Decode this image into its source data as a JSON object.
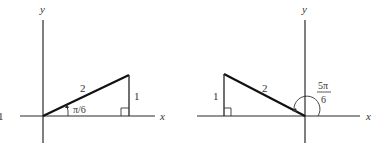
{
  "figure": {
    "panels": [
      {
        "id": "left",
        "axis_labels": {
          "x": "x",
          "y": "y"
        },
        "hypotenuse_label": "2",
        "opposite_label": "1",
        "angle_label": "π/6",
        "edge_fragment": "1",
        "triangle": {
          "origin": [
            43,
            116
          ],
          "top": [
            129,
            75
          ],
          "right_angle": [
            129,
            116
          ]
        }
      },
      {
        "id": "right",
        "axis_labels": {
          "x": "x",
          "y": "y"
        },
        "hypotenuse_label": "2",
        "opposite_label": "1",
        "angle_label_numerator": "5π",
        "angle_label_denominator": "6",
        "triangle": {
          "origin": [
            305,
            116
          ],
          "top": [
            224,
            74
          ],
          "right_angle": [
            224,
            116
          ]
        }
      }
    ],
    "colors": {
      "line": "#111111",
      "axis": "#2a2a2a",
      "text": "#333333",
      "background": "#ffffff"
    }
  }
}
